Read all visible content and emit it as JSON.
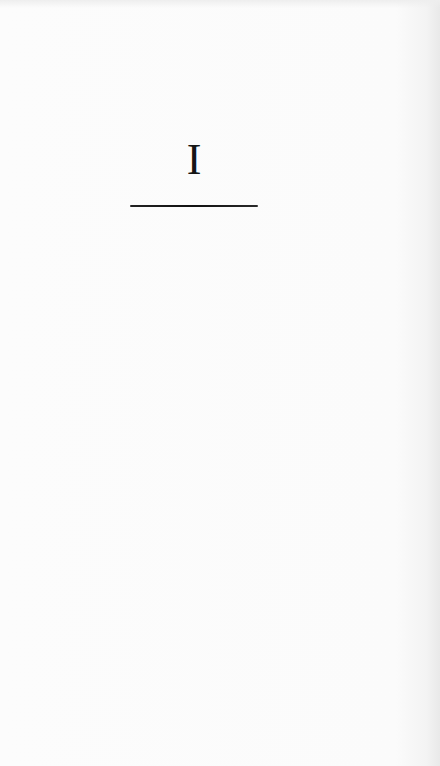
{
  "page": {
    "chapter_number": "I",
    "background_color": "#fbfbfb",
    "text_color": "#151515"
  }
}
